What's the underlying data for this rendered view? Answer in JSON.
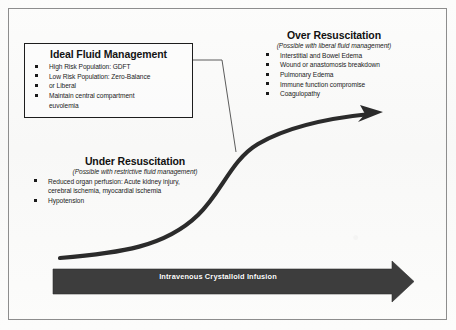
{
  "figure": {
    "background_color": "#fbfbfa",
    "frame_color": "#8d8d8d"
  },
  "ideal_box": {
    "title": "Ideal Fluid Management",
    "border_color": "#1d1d1d",
    "bullets": [
      {
        "text": "High Risk Population: GDFT",
        "bullet": true
      },
      {
        "text": "Low Risk Population: Zero-Balance",
        "bullet": true
      },
      {
        "text": "or Liberal",
        "bullet": true
      },
      {
        "text": "Maintain central compartment",
        "bullet": true
      },
      {
        "text": "euvolemia",
        "bullet": false
      }
    ]
  },
  "over_resuscitation": {
    "heading": "Over Resuscitation",
    "subtitle": "(Possible with liberal fluid management)",
    "bullets": [
      {
        "text": "Interstitial and Bowel Edema",
        "bullet": true
      },
      {
        "text": "Wound or anastomosis breakdown",
        "bullet": true
      },
      {
        "text": "Pulmonary Edema",
        "bullet": true
      },
      {
        "text": "Immune function compromise",
        "bullet": true
      },
      {
        "text": "Coagulopathy",
        "bullet": true
      }
    ]
  },
  "under_resuscitation": {
    "heading": "Under Resuscitation",
    "subtitle": "(Possible with restrictive fluid management)",
    "bullets": [
      {
        "text": "Reduced organ perfusion: Acute kidney injury, cerebral ischemia, myocardial ischemia",
        "bullet": true
      },
      {
        "text": "Hypotension",
        "bullet": true
      }
    ]
  },
  "infusion_arrow": {
    "label": "Intravenous Crystalloid Infusion",
    "fill_color": "#3d3d3d",
    "text_color": "#ffffff"
  },
  "response_curve": {
    "description": "sigmoid dose-response curve with arrowhead",
    "stroke_color": "#2b2b2b"
  },
  "leader_line": {
    "description": "callout leader from ideal fluid management box to curve midpoint",
    "stroke_color": "#4a4a4a"
  }
}
